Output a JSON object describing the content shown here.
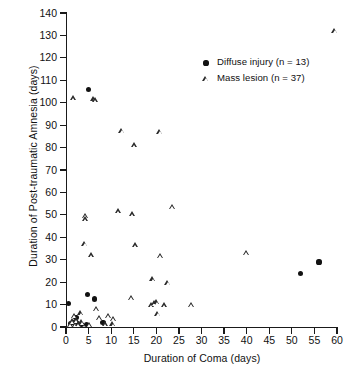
{
  "chart_data": {
    "type": "scatter",
    "title": "",
    "xlabel": "Duration of Coma (days)",
    "ylabel": "Duration of Post-traumatic Amnesia (days)",
    "xlim": [
      0,
      60
    ],
    "ylim": [
      0,
      140
    ],
    "xticks": [
      0,
      5,
      10,
      15,
      20,
      25,
      30,
      35,
      40,
      45,
      50,
      55,
      60
    ],
    "yticks": [
      0,
      10,
      20,
      30,
      40,
      50,
      60,
      70,
      80,
      90,
      100,
      110,
      120,
      130,
      140
    ],
    "grid": false,
    "legend_position": "top-right",
    "series": [
      {
        "name": "Diffuse injury (n = 13)",
        "marker": "filled-circle",
        "color": "#121212",
        "n": 13,
        "points": [
          [
            0.6,
            10.5
          ],
          [
            1.0,
            1.5
          ],
          [
            1.6,
            2.0
          ],
          [
            2.2,
            4.2
          ],
          [
            2.6,
            1.3
          ],
          [
            3.4,
            1.2
          ],
          [
            4.5,
            1.2
          ],
          [
            4.8,
            14.5
          ],
          [
            5.0,
            106.0
          ],
          [
            6.3,
            12.5
          ],
          [
            8.2,
            2.0
          ],
          [
            52.0,
            24.0
          ],
          [
            56.0,
            29.0
          ]
        ]
      },
      {
        "name": "Mass lesion (n = 37)",
        "marker": "open-triangle",
        "color": "#2b2b2b",
        "n": 37,
        "points": [
          [
            1.0,
            1.0
          ],
          [
            1.4,
            2.6
          ],
          [
            1.7,
            102.0
          ],
          [
            1.9,
            5.0
          ],
          [
            2.1,
            1.0
          ],
          [
            2.4,
            3.0
          ],
          [
            2.8,
            1.2
          ],
          [
            3.3,
            6.2
          ],
          [
            3.6,
            2.2
          ],
          [
            4.2,
            37.0
          ],
          [
            4.3,
            49.5
          ],
          [
            4.4,
            48.0
          ],
          [
            5.2,
            1.0
          ],
          [
            5.6,
            32.0
          ],
          [
            6.2,
            101.5
          ],
          [
            6.6,
            101.0
          ],
          [
            6.8,
            8.2
          ],
          [
            7.4,
            4.0
          ],
          [
            8.8,
            1.2
          ],
          [
            9.4,
            5.0
          ],
          [
            10.4,
            1.2
          ],
          [
            10.6,
            3.6
          ],
          [
            11.6,
            51.5
          ],
          [
            12.4,
            87.5
          ],
          [
            14.5,
            13.0
          ],
          [
            14.8,
            50.2
          ],
          [
            15.2,
            81.0
          ],
          [
            15.4,
            36.5
          ],
          [
            19.0,
            9.6
          ],
          [
            19.3,
            21.3
          ],
          [
            19.6,
            10.5
          ],
          [
            20.2,
            11.0
          ],
          [
            20.4,
            5.8
          ],
          [
            20.8,
            87.0
          ],
          [
            20.9,
            31.8
          ],
          [
            21.8,
            9.6
          ],
          [
            22.6,
            19.8
          ],
          [
            23.6,
            53.6
          ],
          [
            27.8,
            9.8
          ],
          [
            40.0,
            33.0
          ],
          [
            59.6,
            132.0
          ]
        ]
      }
    ]
  },
  "legend": {
    "items": [
      {
        "label": "Diffuse injury (n = 13)",
        "marker": "filled-circle"
      },
      {
        "label": "Mass lesion (n = 37)",
        "marker": "open-triangle"
      }
    ]
  },
  "axes": {
    "x_title": "Duration of Coma (days)",
    "y_title": "Duration of Post-traumatic Amnesia (days)"
  }
}
